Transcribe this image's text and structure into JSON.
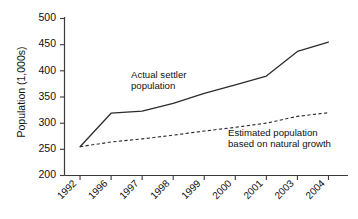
{
  "chart_data": {
    "type": "line",
    "title": "",
    "xlabel": "",
    "ylabel": "Population (1,000s)",
    "categories": [
      "1992",
      "1996",
      "1997",
      "1998",
      "1999",
      "2000",
      "2001",
      "2003",
      "2004"
    ],
    "ylim": [
      200,
      500
    ],
    "yticks": [
      200,
      250,
      300,
      350,
      400,
      450,
      500
    ],
    "ytick_labels": [
      "200",
      "250",
      "300",
      "350",
      "400",
      "450",
      "500"
    ],
    "grid": false,
    "legend_position": "inline-annotations",
    "series": [
      {
        "name": "Actual settler population",
        "style": "solid",
        "color": "#2b2b2b",
        "values": [
          255,
          319,
          323,
          338,
          357,
          373,
          390,
          437,
          455
        ]
      },
      {
        "name": "Estimated population based on natural growth",
        "style": "dashed",
        "color": "#2b2b2b",
        "values": [
          255,
          264,
          270,
          277,
          285,
          292,
          300,
          313,
          320
        ]
      }
    ],
    "annotations": [
      {
        "id": "actual-label",
        "lines": [
          "Actual settler",
          "population"
        ],
        "x_px": 131,
        "y_px": 75
      },
      {
        "id": "estimated-label",
        "lines": [
          "Estimated population",
          "based on natural growth"
        ],
        "x_px": 228,
        "y_px": 133
      }
    ]
  },
  "axes": {
    "y_title": "Population (1,000s)",
    "y_labels": [
      "500",
      "450",
      "400",
      "350",
      "300",
      "250",
      "200"
    ],
    "x_labels": [
      "1992",
      "1996",
      "1997",
      "1998",
      "1999",
      "2000",
      "2001",
      "2003",
      "2004"
    ]
  },
  "annotations": {
    "actual_line1": "Actual settler",
    "actual_line2": "population",
    "estimated_line1": "Estimated population",
    "estimated_line2": "based on natural growth"
  },
  "colors": {
    "background": "#ffffff",
    "ink": "#1a1a1a",
    "axis": "#3a3a3a",
    "series": "#2b2b2b"
  }
}
